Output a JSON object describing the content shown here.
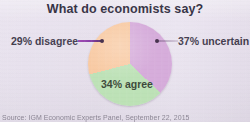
{
  "chart_data": {
    "type": "pie",
    "title": "What do economists say?",
    "categories": [
      "uncertain",
      "agree",
      "disagree"
    ],
    "values": [
      37,
      34,
      29
    ],
    "labels": [
      "37% uncertain",
      "34% agree",
      "29% disagree"
    ],
    "colors": [
      "#d3a6d8",
      "#b9e0b2",
      "#f8c69c"
    ],
    "legend": "none",
    "grid": false,
    "xlabel": "",
    "ylabel": "",
    "annotations": [
      "Source: IGM Economic Experts Panel, September 22, 2015"
    ],
    "start_angle_deg": 0,
    "direction": "clockwise"
  },
  "figure": {
    "title": "What do economists say?",
    "source_note": "Source: IGM Economic Experts Panel, September 22, 2015",
    "background_color": "#e7e0ed",
    "title_color": "#2e2a3c"
  },
  "slices": {
    "uncertain": {
      "label": "37% uncertain",
      "percent": 37,
      "color": "#d3a6d8",
      "label_color": "#3a3447"
    },
    "agree": {
      "label": "34% agree",
      "percent": 34,
      "color": "#b9e0b2",
      "label_color": "#2f3b2c"
    },
    "disagree": {
      "label": "29% disagree",
      "percent": 29,
      "color": "#f8c69c",
      "label_color": "#3a3447",
      "leader_color": "#7e2fa0"
    }
  }
}
